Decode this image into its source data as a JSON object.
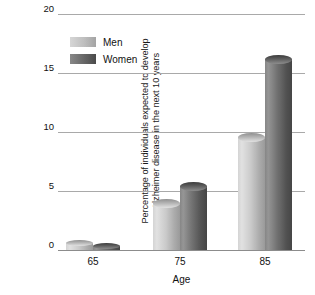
{
  "chart_data": {
    "type": "bar",
    "title": "",
    "xlabel": "Age",
    "ylabel": "Percentage of individuals expected to develop Alzheimer disease in the next 10 years",
    "ylabel_lines": [
      "Percentage of individuals expected to develop",
      "Alzheimer disease in the next 10 years"
    ],
    "categories": [
      "65",
      "75",
      "85"
    ],
    "series": [
      {
        "name": "Men",
        "values": [
          0.6,
          4.0,
          9.6
        ],
        "color": "#c4c4c4"
      },
      {
        "name": "Women",
        "values": [
          0.3,
          5.4,
          16.2
        ],
        "color": "#6a6a6a"
      }
    ],
    "ylim": [
      0,
      20
    ],
    "yticks": [
      "20",
      "15",
      "10",
      "5",
      "0"
    ],
    "ytick_values": [
      20,
      15,
      10,
      5,
      0
    ],
    "grid": true,
    "legend_position": "top-left-inside",
    "bar_style": "cylinder-3d"
  }
}
